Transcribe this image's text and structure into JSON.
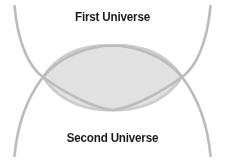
{
  "diagram": {
    "title_top": "First Universe",
    "title_bottom": "Second Universe",
    "type": "venn-intersection",
    "colors": {
      "background": "#ffffff",
      "arc_stroke": "#b9b9b9",
      "lens_fill": "#e2e2e2",
      "lens_edge": "#c9c9c9",
      "text": "#1b1b1b"
    },
    "geometry": {
      "left_intersection": "43,77",
      "right_intersection": "182,77",
      "lens_top": "112,46",
      "lens_bottom": "112,110",
      "arc_top_left_tip": "14,6",
      "arc_top_right_tip": "211,6",
      "arc_bottom_left_tip": "14,156",
      "arc_bottom_right_tip": "211,156"
    }
  }
}
